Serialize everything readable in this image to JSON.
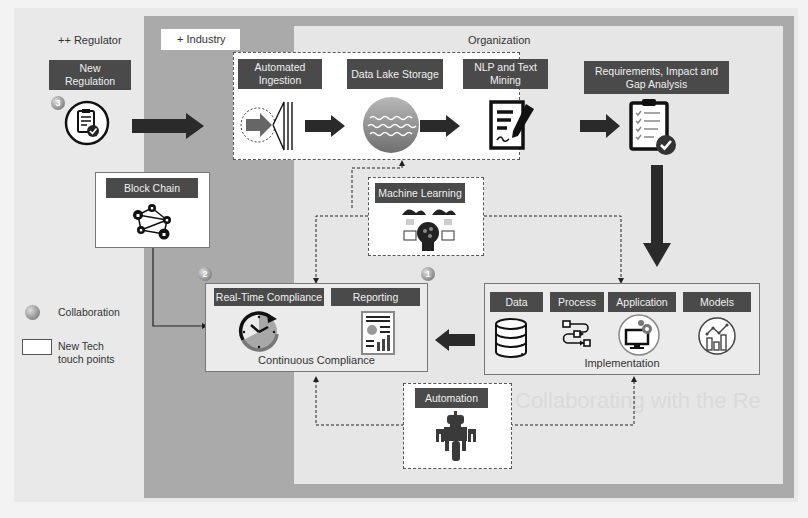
{
  "zones": {
    "regulator": "++ Regulator",
    "industry": "+ Industry",
    "organization": "Organization"
  },
  "regulator": {
    "new_regulation": "New\nRegulation",
    "badge": "3"
  },
  "pipeline": {
    "automated_ingestion": "Automated Ingestion",
    "data_lake_storage": "Data Lake Storage",
    "nlp_text_mining": "NLP and Text Mining"
  },
  "analysis": {
    "title": "Requirements, Impact and Gap Analysis"
  },
  "block_chain": {
    "title": "Block Chain"
  },
  "machine_learning": {
    "title": "Machine Learning"
  },
  "continuous_compliance": {
    "real_time": "Real-Time Compliance",
    "reporting": "Reporting",
    "caption": "Continuous Compliance",
    "badge_left": "2",
    "badge_right": "1"
  },
  "implementation": {
    "items": [
      "Data",
      "Process",
      "Application",
      "Models"
    ],
    "caption": "Implementation"
  },
  "automation": {
    "title": "Automation"
  },
  "legend": {
    "collaboration": "Collaboration",
    "new_tech": "New Tech\ntouch points"
  },
  "ghost_text": "Collaborating with the Re",
  "colors": {
    "label_bg": "#4a4a4a",
    "industry_zone": "#aaaaaa",
    "org_zone": "#e6e6e6",
    "arrow": "#2a2a2a"
  }
}
